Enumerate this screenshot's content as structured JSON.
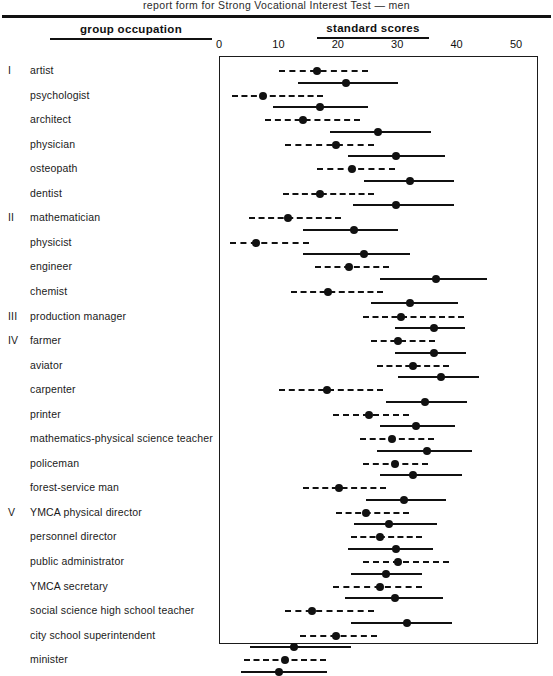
{
  "caption": "report form for Strong Vocational Interest Test — men",
  "header": {
    "group_occupation": "group occupation",
    "standard_scores": "standard scores"
  },
  "axis": {
    "ticks": [
      "0",
      "10",
      "20",
      "30",
      "40",
      "50"
    ],
    "min": 0,
    "max": 54,
    "label": "standard scores"
  },
  "chart_data": {
    "type": "range-plot",
    "title": "report form for Strong Vocational Interest Test — men",
    "xlabel": "standard scores",
    "ylabel": "group occupation",
    "xlim": [
      0,
      54
    ],
    "ticks": [
      0,
      10,
      20,
      30,
      40,
      50
    ],
    "grid": false,
    "legend": [
      {
        "name": "dashed range",
        "style": "dashed"
      },
      {
        "name": "solid range",
        "style": "solid"
      }
    ],
    "series_note": "Each occupation has two horizontal ranges: an upper dashed range and a lower solid range, each with a filled circle marker at its mean.",
    "rows": [
      {
        "group": "I",
        "occupation": "artist",
        "dashed": {
          "low": 10.0,
          "mean": 16.3,
          "high": 24.9
        },
        "solid": {
          "low": 13.1,
          "mean": 21.2,
          "high": 29.9
        }
      },
      {
        "group": "",
        "occupation": "psychologist",
        "dashed": {
          "low": 2.1,
          "mean": 7.2,
          "high": 17.3
        },
        "solid": {
          "low": 9.0,
          "mean": 16.8,
          "high": 25.0
        }
      },
      {
        "group": "",
        "occupation": "architect",
        "dashed": {
          "low": 7.6,
          "mean": 14.0,
          "high": 23.5
        },
        "solid": {
          "low": 18.5,
          "mean": 26.6,
          "high": 35.6
        }
      },
      {
        "group": "",
        "occupation": "physician",
        "dashed": {
          "low": 11.0,
          "mean": 19.6,
          "high": 26.0
        },
        "solid": {
          "low": 21.6,
          "mean": 29.6,
          "high": 37.8
        }
      },
      {
        "group": "",
        "occupation": "osteopath",
        "dashed": {
          "low": 16.4,
          "mean": 22.3,
          "high": 29.5
        },
        "solid": {
          "low": 24.2,
          "mean": 32.0,
          "high": 39.4
        }
      },
      {
        "group": "",
        "occupation": "dentist",
        "dashed": {
          "low": 10.6,
          "mean": 16.8,
          "high": 26.0
        },
        "solid": {
          "low": 22.4,
          "mean": 29.6,
          "high": 39.4
        }
      },
      {
        "group": "II",
        "occupation": "mathematician",
        "dashed": {
          "low": 4.9,
          "mean": 11.5,
          "high": 20.4
        },
        "solid": {
          "low": 14.0,
          "mean": 22.5,
          "high": 30.0
        }
      },
      {
        "group": "",
        "occupation": "physicist",
        "dashed": {
          "low": 1.6,
          "mean": 6.0,
          "high": 15.0
        },
        "solid": {
          "low": 14.0,
          "mean": 24.3,
          "high": 32.0
        }
      },
      {
        "group": "",
        "occupation": "engineer",
        "dashed": {
          "low": 16.0,
          "mean": 21.8,
          "high": 28.4
        },
        "solid": {
          "low": 27.0,
          "mean": 36.4,
          "high": 45.0
        }
      },
      {
        "group": "",
        "occupation": "chemist",
        "dashed": {
          "low": 12.0,
          "mean": 18.2,
          "high": 27.5
        },
        "solid": {
          "low": 25.5,
          "mean": 32.0,
          "high": 40.0
        }
      },
      {
        "group": "III",
        "occupation": "production manager",
        "dashed": {
          "low": 24.0,
          "mean": 30.5,
          "high": 41.0
        },
        "solid": {
          "low": 29.5,
          "mean": 36.0,
          "high": 41.2
        }
      },
      {
        "group": "IV",
        "occupation": "farmer",
        "dashed": {
          "low": 25.5,
          "mean": 30.0,
          "high": 36.2
        },
        "solid": {
          "low": 29.5,
          "mean": 36.0,
          "high": 41.4
        }
      },
      {
        "group": "",
        "occupation": "aviator",
        "dashed": {
          "low": 26.5,
          "mean": 32.5,
          "high": 38.5
        },
        "solid": {
          "low": 30.0,
          "mean": 37.2,
          "high": 43.6
        }
      },
      {
        "group": "",
        "occupation": "carpenter",
        "dashed": {
          "low": 10.0,
          "mean": 18.0,
          "high": 27.5
        },
        "solid": {
          "low": 28.0,
          "mean": 34.5,
          "high": 41.5
        }
      },
      {
        "group": "",
        "occupation": "printer",
        "dashed": {
          "low": 19.0,
          "mean": 25.0,
          "high": 31.8
        },
        "solid": {
          "low": 27.0,
          "mean": 33.0,
          "high": 39.5
        }
      },
      {
        "group": "",
        "occupation": "mathematics-physical science teacher",
        "dashed": {
          "low": 23.5,
          "mean": 29.0,
          "high": 36.0
        },
        "solid": {
          "low": 26.5,
          "mean": 34.8,
          "high": 42.5
        }
      },
      {
        "group": "",
        "occupation": "policeman",
        "dashed": {
          "low": 24.0,
          "mean": 29.5,
          "high": 35.0
        },
        "solid": {
          "low": 27.0,
          "mean": 32.5,
          "high": 40.8
        }
      },
      {
        "group": "",
        "occupation": "forest-service man",
        "dashed": {
          "low": 14.0,
          "mean": 20.0,
          "high": 28.0
        },
        "solid": {
          "low": 24.5,
          "mean": 31.0,
          "high": 38.0
        }
      },
      {
        "group": "V",
        "occupation": "YMCA physical director",
        "dashed": {
          "low": 19.5,
          "mean": 24.5,
          "high": 31.8
        },
        "solid": {
          "low": 22.5,
          "mean": 28.5,
          "high": 36.6
        }
      },
      {
        "group": "",
        "occupation": "personnel director",
        "dashed": {
          "low": 22.0,
          "mean": 27.0,
          "high": 34.0
        },
        "solid": {
          "low": 21.5,
          "mean": 29.6,
          "high": 35.8
        }
      },
      {
        "group": "",
        "occupation": "public administrator",
        "dashed": {
          "low": 24.0,
          "mean": 30.0,
          "high": 38.5
        },
        "solid": {
          "low": 22.0,
          "mean": 28.0,
          "high": 34.0
        }
      },
      {
        "group": "",
        "occupation": "YMCA secretary",
        "dashed": {
          "low": 19.0,
          "mean": 27.0,
          "high": 34.0
        },
        "solid": {
          "low": 21.0,
          "mean": 29.5,
          "high": 37.5
        }
      },
      {
        "group": "",
        "occupation": "social science high school teacher",
        "dashed": {
          "low": 11.0,
          "mean": 15.5,
          "high": 26.0
        },
        "solid": {
          "low": 22.0,
          "mean": 31.5,
          "high": 39.0
        }
      },
      {
        "group": "",
        "occupation": "city school superintendent",
        "dashed": {
          "low": 13.5,
          "mean": 19.5,
          "high": 26.5
        },
        "solid": {
          "low": 5.0,
          "mean": 12.4,
          "high": 22.0
        }
      },
      {
        "group": "",
        "occupation": "minister",
        "dashed": {
          "low": 4.0,
          "mean": 11.0,
          "high": 17.8
        },
        "solid": {
          "low": 3.5,
          "mean": 10.0,
          "high": 18.0
        }
      }
    ]
  }
}
